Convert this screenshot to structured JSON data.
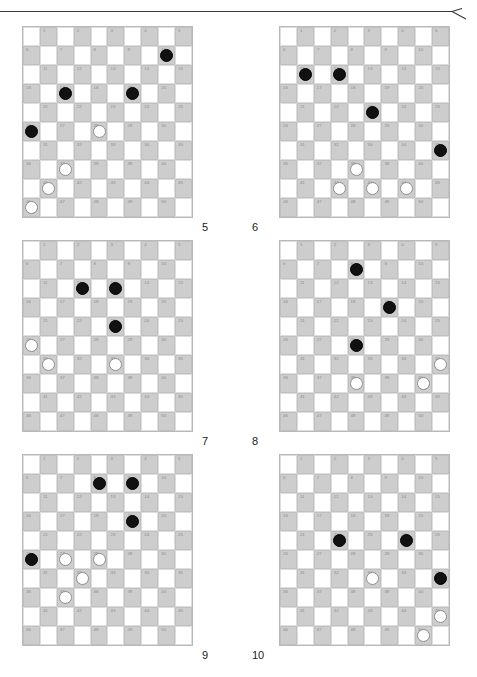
{
  "page": {
    "background_color": "#ffffff",
    "top_rule": {
      "name": "horizontal-rule-with-arrow",
      "color": "#3a3a3a"
    }
  },
  "board_spec": {
    "size": 10,
    "numbered_squares": 50,
    "dark_square_color": "#cdcdcd",
    "light_square_color": "#ffffff",
    "border_color": "#b9b9b9",
    "number_color": "#8c8c8c",
    "black_piece_color": "#111111",
    "white_piece_color": "#ffffff",
    "numbering_note": "Squares 1-50 are numbered left-to-right, top-to-bottom on the dark squares; odd rows use columns 2,4,6,8,10 and even rows use columns 1,3,5,7,9."
  },
  "diagrams": [
    {
      "label": "5",
      "position": "top-left",
      "black_pieces": [
        {
          "row": 2,
          "col": 9
        },
        {
          "row": 4,
          "col": 3
        },
        {
          "row": 4,
          "col": 7
        },
        {
          "row": 6,
          "col": 1
        }
      ],
      "white_pieces": [
        {
          "row": 6,
          "col": 5
        },
        {
          "row": 8,
          "col": 3
        },
        {
          "row": 9,
          "col": 2
        },
        {
          "row": 10,
          "col": 1
        }
      ]
    },
    {
      "label": "6",
      "position": "top-right",
      "black_pieces": [
        {
          "row": 3,
          "col": 2
        },
        {
          "row": 3,
          "col": 4
        },
        {
          "row": 5,
          "col": 6
        },
        {
          "row": 7,
          "col": 10
        }
      ],
      "white_pieces": [
        {
          "row": 8,
          "col": 5
        },
        {
          "row": 9,
          "col": 4
        },
        {
          "row": 9,
          "col": 6
        },
        {
          "row": 9,
          "col": 8
        }
      ]
    },
    {
      "label": "7",
      "position": "middle-left",
      "black_pieces": [
        {
          "row": 3,
          "col": 4
        },
        {
          "row": 3,
          "col": 6
        },
        {
          "row": 5,
          "col": 6
        }
      ],
      "white_pieces": [
        {
          "row": 6,
          "col": 1
        },
        {
          "row": 7,
          "col": 2
        },
        {
          "row": 7,
          "col": 6
        }
      ]
    },
    {
      "label": "8",
      "position": "middle-right",
      "black_pieces": [
        {
          "row": 2,
          "col": 5
        },
        {
          "row": 4,
          "col": 7
        },
        {
          "row": 6,
          "col": 5
        }
      ],
      "white_pieces": [
        {
          "row": 7,
          "col": 10
        },
        {
          "row": 8,
          "col": 5
        },
        {
          "row": 8,
          "col": 9
        }
      ]
    },
    {
      "label": "9",
      "position": "bottom-left",
      "black_pieces": [
        {
          "row": 2,
          "col": 5
        },
        {
          "row": 2,
          "col": 7
        },
        {
          "row": 4,
          "col": 7
        },
        {
          "row": 6,
          "col": 1
        }
      ],
      "white_pieces": [
        {
          "row": 6,
          "col": 3
        },
        {
          "row": 6,
          "col": 5
        },
        {
          "row": 7,
          "col": 4
        },
        {
          "row": 8,
          "col": 3
        }
      ]
    },
    {
      "label": "10",
      "position": "bottom-right",
      "black_pieces": [
        {
          "row": 5,
          "col": 4
        },
        {
          "row": 5,
          "col": 8
        },
        {
          "row": 7,
          "col": 10
        }
      ],
      "white_pieces": [
        {
          "row": 7,
          "col": 6
        },
        {
          "row": 9,
          "col": 10
        },
        {
          "row": 10,
          "col": 9
        }
      ]
    }
  ]
}
